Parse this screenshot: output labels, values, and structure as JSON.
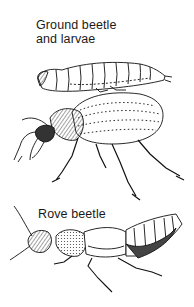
{
  "illustration": {
    "ground_beetle_label": [
      "Ground beetle",
      "and larvae"
    ],
    "rove_beetle_label": "Rove beetle",
    "subjects": [
      "ground-beetle-larva",
      "ground-beetle-adult",
      "rove-beetle"
    ],
    "colors": {
      "ink": "#111111",
      "background": "#ffffff",
      "shade": "#555555"
    }
  }
}
